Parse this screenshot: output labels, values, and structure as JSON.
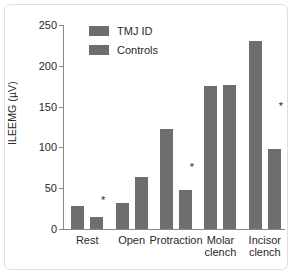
{
  "chart_data": {
    "type": "bar",
    "title": "",
    "xlabel": "",
    "ylabel": "ILEEMG (µV)",
    "ylim": [
      0,
      250
    ],
    "yticks": [
      0,
      50,
      100,
      150,
      200,
      250
    ],
    "ytick_labels": [
      "0",
      "50",
      "100",
      "150",
      "200",
      "250"
    ],
    "grid": false,
    "legend_position": "top-left-inside",
    "categories": [
      "Rest",
      "Open",
      "Protraction",
      "Molar\nclench",
      "Incisor\nclench"
    ],
    "series": [
      {
        "name": "TMJ ID",
        "color": "#6e6e6e",
        "values": [
          28,
          32,
          123,
          175,
          230
        ]
      },
      {
        "name": "Controls",
        "color": "#6e6e6e",
        "values": [
          15,
          64,
          48,
          177,
          98
        ]
      }
    ],
    "annotations": [
      {
        "text": "*",
        "category": "Rest",
        "y": 36
      },
      {
        "text": "*",
        "category": "Protraction",
        "y": 76
      },
      {
        "text": "*",
        "category": "Incisor\nclench",
        "y": 151
      }
    ]
  },
  "legend": {
    "items": [
      {
        "label": "TMJ ID",
        "color": "#6e6e6e"
      },
      {
        "label": "Controls",
        "color": "#6e6e6e"
      }
    ]
  },
  "axes": {
    "y_label": "ILEEMG (µV)",
    "y_ticks": [
      "250",
      "200",
      "150",
      "100",
      "50",
      "0"
    ],
    "x_labels": [
      "Rest",
      "Open",
      "Protraction",
      "Molar\nclench",
      "Incisor\nclench"
    ]
  },
  "colors": {
    "bar": "#6e6e6e",
    "axis": "#8a8784",
    "text": "#2b2a29",
    "frame": "#e2e0de",
    "background": "#ffffff"
  }
}
